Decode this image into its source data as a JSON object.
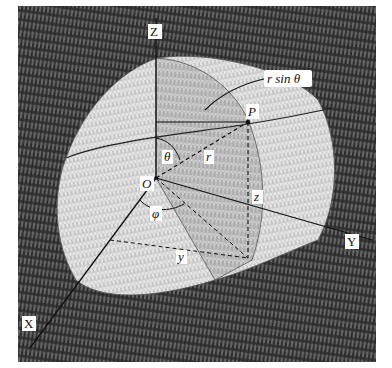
{
  "diagram": {
    "colors": {
      "background_dark": "#2a2a2a",
      "background_mid": "#5a5a5a",
      "solid_light": "#d9d9d9",
      "solid_shade": "#b8b8b8",
      "line": "#111111",
      "label_bg": "#ffffff"
    },
    "labels": {
      "axis_z": "Z",
      "axis_y": "Y",
      "axis_x": "X",
      "origin": "O",
      "point": "P",
      "radius": "r",
      "polar_angle": "θ",
      "azimuth": "φ",
      "height": "z",
      "y_coord": "y",
      "r_sin_theta": "r sin θ"
    }
  }
}
